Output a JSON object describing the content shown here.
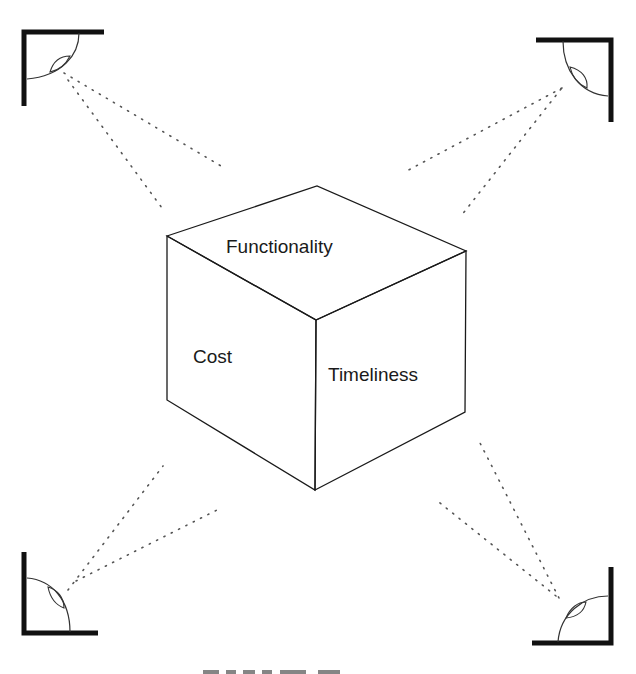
{
  "diagram": {
    "cube": {
      "faces": {
        "top": "Functionality",
        "left": "Cost",
        "right": "Timeliness"
      }
    },
    "viewers": [
      {
        "position": "top-left",
        "icon": "corner-viewer-icon"
      },
      {
        "position": "top-right",
        "icon": "corner-viewer-icon"
      },
      {
        "position": "bottom-left",
        "icon": "corner-viewer-icon"
      },
      {
        "position": "bottom-right",
        "icon": "corner-viewer-icon"
      }
    ],
    "colors": {
      "line": "#1a1a1a",
      "dots": "#555555",
      "background": "#ffffff"
    }
  }
}
